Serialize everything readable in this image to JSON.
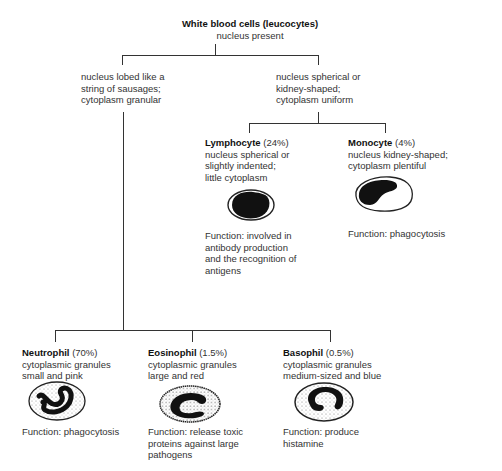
{
  "root": {
    "title": "White blood cells (leucocytes)",
    "subtitle": "nucleus present"
  },
  "branches": {
    "granular": {
      "description": [
        "nucleus lobed like a",
        "string of sausages;",
        "cytoplasm granular"
      ]
    },
    "uniform": {
      "description": [
        "nucleus spherical or",
        "kidney-shaped;",
        "cytoplasm uniform"
      ]
    }
  },
  "cells": {
    "lymphocyte": {
      "name": "Lymphocyte",
      "percent": "(24%)",
      "description": [
        "nucleus spherical or",
        "slightly indented;",
        "little cytoplasm"
      ],
      "function": [
        "Function: involved in",
        "antibody production",
        "and the recognition of",
        "antigens"
      ]
    },
    "monocyte": {
      "name": "Monocyte",
      "percent": "(4%)",
      "description": [
        "nucleus kidney-shaped;",
        "cytoplasm plentiful"
      ],
      "function": [
        "Function: phagocytosis"
      ]
    },
    "neutrophil": {
      "name": "Neutrophil",
      "percent": "(70%)",
      "description": [
        "cytoplasmic granules",
        "small and pink"
      ],
      "function": [
        "Function: phagocytosis"
      ]
    },
    "eosinophil": {
      "name": "Eosinophil",
      "percent": "(1.5%)",
      "description": [
        "cytoplasmic granules",
        "large and red"
      ],
      "function": [
        "Function: release toxic",
        "proteins against large",
        "pathogens"
      ]
    },
    "basophil": {
      "name": "Basophil",
      "percent": "(0.5%)",
      "description": [
        "cytoplasmic granules",
        "medium-sized and blue"
      ],
      "function": [
        "Function: produce",
        "histamine"
      ]
    }
  },
  "icons": {
    "lymphocyte": "cell-round-nucleus-icon",
    "monocyte": "cell-kidney-nucleus-icon",
    "neutrophil": "cell-lobed-nucleus-icon",
    "eosinophil": "cell-bilobed-nucleus-icon",
    "basophil": "cell-s-nucleus-icon"
  },
  "colors": {
    "line": "#333333",
    "text": "#333333",
    "nucleus": "#111111",
    "background": "#ffffff"
  }
}
